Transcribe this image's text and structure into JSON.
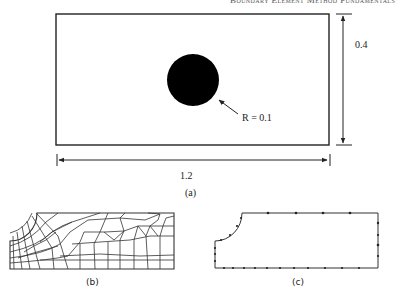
{
  "header": {
    "running_title": "Boundary Element Method Fundamentals"
  },
  "figure_a": {
    "label": "(a)",
    "width_dimension": "1.2",
    "height_dimension": "0.4",
    "radius_annotation": "R = 0.1",
    "plate": {
      "x": 56,
      "y": 14,
      "w": 273,
      "h": 131
    },
    "hole": {
      "cx": 193,
      "cy": 80,
      "r": 26,
      "fill": "#000000"
    }
  },
  "figure_b": {
    "label": "(b)",
    "description": "Finite element mesh of quarter plate with hole"
  },
  "figure_c": {
    "label": "(c)",
    "description": "Boundary element discretization of quarter plate with hole"
  },
  "colors": {
    "line": "#222222",
    "background": "#ffffff"
  }
}
